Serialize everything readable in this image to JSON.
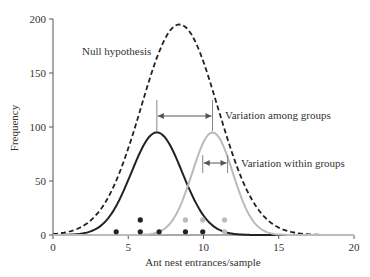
{
  "chart_data": {
    "type": "line",
    "title": "",
    "xlabel": "Ant nest entrances/sample",
    "ylabel": "Frequency",
    "xlim": [
      0,
      20
    ],
    "ylim": [
      0,
      200
    ],
    "xticks": [
      "0",
      "5",
      "10",
      "15",
      "20"
    ],
    "yticks": [
      "0",
      "50",
      "100",
      "150",
      "200"
    ],
    "grid": false,
    "legend": "none",
    "series": [
      {
        "name": "Null hypothesis",
        "style": "dashed",
        "color": "#222222",
        "mean": 8.4,
        "sd": 2.55,
        "peak": 195
      },
      {
        "name": "Group 1",
        "style": "solid",
        "color": "#222222",
        "mean": 6.9,
        "sd": 1.7,
        "peak": 95
      },
      {
        "name": "Group 2",
        "style": "solid",
        "color": "#bbbbbb",
        "mean": 10.6,
        "sd": 1.35,
        "peak": 95
      }
    ],
    "points": [
      {
        "group": "Group 1",
        "color": "#222222",
        "x": 4.2,
        "y": 3
      },
      {
        "group": "Group 1",
        "color": "#222222",
        "x": 5.8,
        "y": 3
      },
      {
        "group": "Group 1",
        "color": "#222222",
        "x": 5.8,
        "y": 14
      },
      {
        "group": "Group 1",
        "color": "#222222",
        "x": 7.05,
        "y": 3
      },
      {
        "group": "Group 1",
        "color": "#222222",
        "x": 8.8,
        "y": 3
      },
      {
        "group": "Group 1",
        "color": "#222222",
        "x": 9.95,
        "y": 3
      },
      {
        "group": "Group 2",
        "color": "#bbbbbb",
        "x": 8.8,
        "y": 14
      },
      {
        "group": "Group 2",
        "color": "#bbbbbb",
        "x": 9.95,
        "y": 14
      },
      {
        "group": "Group 2",
        "color": "#bbbbbb",
        "x": 11.4,
        "y": 14
      },
      {
        "group": "Group 2",
        "color": "#bbbbbb",
        "x": 11.4,
        "y": 3
      }
    ],
    "annotations": [
      {
        "text": "Null hypothesis",
        "x": 1.8,
        "y": 168
      },
      {
        "text": "Variation among groups",
        "x_from": 6.9,
        "x_to": 10.6,
        "y": 110,
        "label": "Variation among groups"
      },
      {
        "text": "Variation within groups",
        "x_from": 9.95,
        "x_to": 11.6,
        "y": 67,
        "label": "Variation within groups"
      }
    ]
  },
  "labels": {
    "null": "Null hypothesis",
    "among": "Variation among groups",
    "within": "Variation within groups",
    "xlabel": "Ant nest entrances/sample",
    "ylabel": "Frequency"
  }
}
